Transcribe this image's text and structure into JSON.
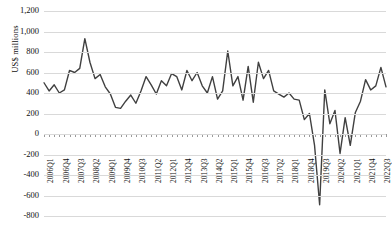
{
  "chart": {
    "ylabel": "US$ millions",
    "units": "US$ millions"
  },
  "chart_data": {
    "type": "line",
    "title": "",
    "xlabel": "",
    "ylabel": "US$ millions",
    "ylim": [
      -800,
      1200
    ],
    "ytick_step": 200,
    "yticks": [
      "1,200",
      "1,000",
      "800",
      "600",
      "400",
      "200",
      "0",
      "-200",
      "-400",
      "-600",
      "-800"
    ],
    "ytick_values": [
      1200,
      1000,
      800,
      600,
      400,
      200,
      0,
      -200,
      -400,
      -600,
      -800
    ],
    "grid": true,
    "legend": "none",
    "line_color": "#404040",
    "x_label_interval": 3,
    "categories": [
      "2006Q1",
      "2006Q2",
      "2006Q3",
      "2006Q4",
      "2007Q1",
      "2007Q2",
      "2007Q3",
      "2007Q4",
      "2008Q1",
      "2008Q2",
      "2008Q3",
      "2008Q4",
      "2009Q1",
      "2009Q2",
      "2009Q3",
      "2009Q4",
      "2010Q1",
      "2010Q2",
      "2010Q3",
      "2010Q4",
      "2011Q1",
      "2011Q2",
      "2011Q3",
      "2011Q4",
      "2012Q1",
      "2012Q2",
      "2012Q3",
      "2012Q4",
      "2013Q1",
      "2013Q2",
      "2013Q3",
      "2013Q4",
      "2014Q1",
      "2014Q2",
      "2014Q3",
      "2014Q4",
      "2015Q1",
      "2015Q2",
      "2015Q3",
      "2015Q4",
      "2016Q1",
      "2016Q2",
      "2016Q3",
      "2016Q4",
      "2017Q1",
      "2017Q2",
      "2017Q3",
      "2017Q4",
      "2018Q1",
      "2018Q2",
      "2018Q3",
      "2018Q4",
      "2019Q1",
      "2019Q2",
      "2019Q3",
      "2019Q4",
      "2020Q1",
      "2020Q2",
      "2020Q3",
      "2020Q4",
      "2021Q1",
      "2021Q2",
      "2021Q3",
      "2021Q4",
      "2022Q1",
      "2022Q2",
      "2022Q3",
      "2022Q4"
    ],
    "xtick_labels": [
      "2006Q1",
      "2006Q4",
      "2007Q3",
      "2008Q2",
      "2009Q1",
      "2009Q4",
      "2010Q3",
      "2011Q2",
      "2012Q1",
      "2012Q4",
      "2013Q3",
      "2014Q2",
      "2015Q1",
      "2015Q4",
      "2016Q3",
      "2017Q2",
      "2018Q1",
      "2018Q4",
      "2019Q3",
      "2020Q2",
      "2021Q1",
      "2021Q4",
      "2022Q3"
    ],
    "values": [
      500,
      420,
      480,
      400,
      430,
      620,
      600,
      640,
      930,
      700,
      540,
      580,
      460,
      390,
      260,
      250,
      320,
      380,
      300,
      420,
      560,
      480,
      390,
      520,
      470,
      590,
      560,
      430,
      620,
      520,
      600,
      470,
      400,
      560,
      340,
      420,
      810,
      470,
      560,
      330,
      660,
      310,
      700,
      540,
      620,
      420,
      390,
      360,
      400,
      340,
      330,
      140,
      200,
      -110,
      -690,
      430,
      100,
      230,
      -190,
      160,
      -110,
      210,
      320,
      530,
      430,
      470,
      650,
      460
    ],
    "series": [
      {
        "name": "Quarterly value",
        "values": [
          500,
          420,
          480,
          400,
          430,
          620,
          600,
          640,
          930,
          700,
          540,
          580,
          460,
          390,
          260,
          250,
          320,
          380,
          300,
          420,
          560,
          480,
          390,
          520,
          470,
          590,
          560,
          430,
          620,
          520,
          600,
          470,
          400,
          560,
          340,
          420,
          810,
          470,
          560,
          330,
          660,
          310,
          700,
          540,
          620,
          420,
          390,
          360,
          400,
          340,
          330,
          140,
          200,
          -110,
          -690,
          430,
          100,
          230,
          -190,
          160,
          -110,
          210,
          320,
          530,
          430,
          470,
          650,
          460
        ]
      }
    ],
    "annotations": {
      "max_value": 930,
      "max_label": "2008Q1",
      "min_value": -690,
      "min_label": "2020Q1"
    }
  }
}
